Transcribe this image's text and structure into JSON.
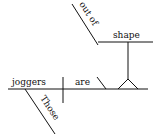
{
  "diagram": {
    "type": "sentence-diagram",
    "words": {
      "subject": "joggers",
      "verb": "are",
      "complement": "shape",
      "preposition": "out of",
      "modifier": "Those"
    }
  }
}
